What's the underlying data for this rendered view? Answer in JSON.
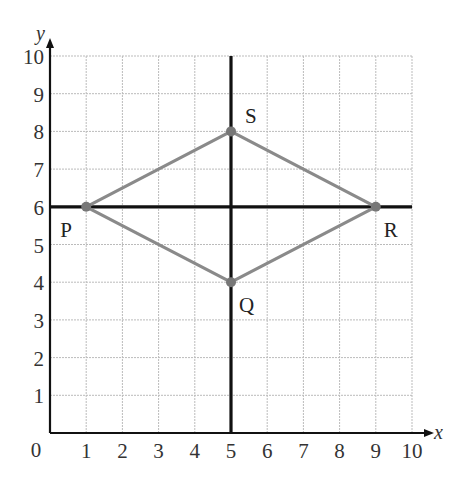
{
  "chart_data": {
    "type": "scatter",
    "title": "",
    "xlabel": "x",
    "ylabel": "y",
    "xlim": [
      0,
      10
    ],
    "ylim": [
      0,
      10
    ],
    "grid": true,
    "origin_label": "0",
    "x_ticks": [
      "1",
      "2",
      "3",
      "4",
      "5",
      "6",
      "7",
      "8",
      "9",
      "10"
    ],
    "y_ticks": [
      "1",
      "2",
      "3",
      "4",
      "5",
      "6",
      "7",
      "8",
      "9",
      "10"
    ],
    "points": [
      {
        "name": "P",
        "x": 1,
        "y": 6,
        "label_position": "bottom-left"
      },
      {
        "name": "Q",
        "x": 5,
        "y": 4,
        "label_position": "bottom-right"
      },
      {
        "name": "R",
        "x": 9,
        "y": 6,
        "label_position": "bottom-right"
      },
      {
        "name": "S",
        "x": 5,
        "y": 8,
        "label_position": "top-right"
      }
    ],
    "polygon": [
      "P",
      "S",
      "R",
      "Q"
    ],
    "reference_lines": [
      {
        "type": "horizontal",
        "y": 6,
        "from_x": 0,
        "to_x": 10
      },
      {
        "type": "vertical",
        "x": 5,
        "from_y": 0,
        "to_y": 10
      }
    ],
    "colors": {
      "edge": "#8a8a8a",
      "axis": "#111111",
      "grid": "#bbbbbb"
    }
  }
}
